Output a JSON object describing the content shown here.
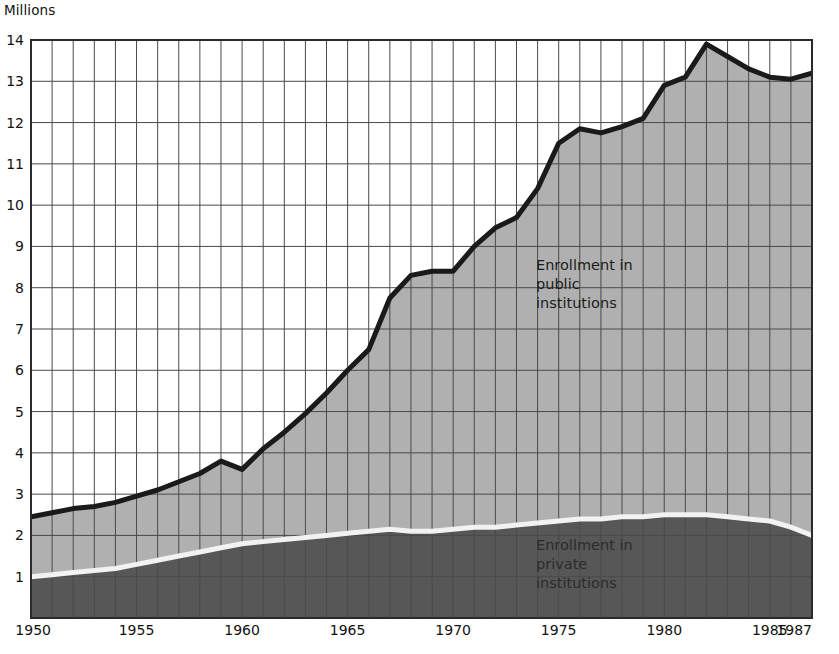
{
  "chart_data": {
    "type": "area",
    "title": "",
    "subtitle": "",
    "ylabel": "Millions",
    "xlabel": "",
    "ylim": [
      0,
      14
    ],
    "xlim": [
      1950,
      1987
    ],
    "grid": true,
    "legend_position": "inside-plot",
    "y_ticks": [
      1,
      2,
      3,
      4,
      5,
      6,
      7,
      8,
      9,
      10,
      11,
      12,
      13,
      14
    ],
    "x_ticks": [
      1950,
      1955,
      1960,
      1965,
      1970,
      1975,
      1980,
      1985,
      1987
    ],
    "x_minor_step": 1,
    "x": [
      1950,
      1951,
      1952,
      1953,
      1954,
      1955,
      1956,
      1957,
      1958,
      1959,
      1960,
      1961,
      1962,
      1963,
      1964,
      1965,
      1966,
      1967,
      1968,
      1969,
      1970,
      1971,
      1972,
      1973,
      1974,
      1975,
      1976,
      1977,
      1978,
      1979,
      1980,
      1981,
      1982,
      1983,
      1984,
      1985,
      1986,
      1987
    ],
    "series": [
      {
        "name": "Enrollment in private institutions",
        "color": "#575757",
        "stacked_order": 1,
        "values": [
          1.0,
          1.05,
          1.1,
          1.15,
          1.2,
          1.3,
          1.4,
          1.5,
          1.6,
          1.7,
          1.8,
          1.85,
          1.9,
          1.95,
          2.0,
          2.05,
          2.1,
          2.15,
          2.1,
          2.1,
          2.15,
          2.2,
          2.2,
          2.25,
          2.3,
          2.35,
          2.4,
          2.4,
          2.45,
          2.45,
          2.5,
          2.5,
          2.5,
          2.45,
          2.4,
          2.35,
          2.2,
          2.0
        ]
      },
      {
        "name": "Enrollment in public institutions",
        "color": "#b0b0b0",
        "stacked_order": 2,
        "values": [
          1.45,
          1.5,
          1.55,
          1.55,
          1.6,
          1.65,
          1.7,
          1.8,
          1.9,
          2.1,
          1.8,
          2.25,
          2.6,
          3.0,
          3.45,
          3.95,
          4.4,
          5.6,
          6.2,
          6.3,
          6.25,
          6.8,
          7.25,
          7.45,
          8.1,
          9.15,
          9.45,
          9.35,
          9.45,
          9.65,
          10.4,
          10.6,
          11.4,
          11.15,
          10.9,
          10.75,
          10.85,
          11.2
        ]
      }
    ],
    "total": {
      "name": "Total enrollment (top boundary)",
      "color": "#1a1a1a",
      "values": [
        2.45,
        2.55,
        2.65,
        2.7,
        2.8,
        2.95,
        3.1,
        3.3,
        3.5,
        3.8,
        3.6,
        4.1,
        4.5,
        4.95,
        5.45,
        6.0,
        6.5,
        7.75,
        8.3,
        8.4,
        8.4,
        9.0,
        9.45,
        9.7,
        10.4,
        11.5,
        11.85,
        11.75,
        11.9,
        12.1,
        12.9,
        13.1,
        13.9,
        13.6,
        13.3,
        13.1,
        13.05,
        13.2
      ]
    },
    "annotations": [
      {
        "id": "public-label",
        "text": "Enrollment in\npublic\ninstitutions",
        "x": 1974.5,
        "y": 8.6
      },
      {
        "id": "private-label",
        "text": "Enrollment in\nprivate\ninstitutions",
        "x": 1974.5,
        "y": 1.9
      }
    ]
  },
  "axis": {
    "y_title": "Millions",
    "y_tick_labels": [
      "14",
      "13",
      "12",
      "11",
      "10",
      "9",
      "8",
      "7",
      "6",
      "5",
      "4",
      "3",
      "2",
      "1"
    ],
    "x_tick_labels": [
      "1950",
      "1955",
      "1960",
      "1965",
      "1970",
      "1975",
      "1980",
      "1985",
      "1987"
    ]
  },
  "labels": {
    "public": "Enrollment in\npublic\ninstitutions",
    "private": "Enrollment in\nprivate\ninstitutions"
  },
  "colors": {
    "public_fill": "#b0b0b0",
    "private_fill": "#575757",
    "total_line": "#1a1a1a",
    "private_line": "#f2f2f2",
    "grid": "#4a4a4a",
    "plot_bg": "#ffffff",
    "page_bg": "#ffffff"
  }
}
